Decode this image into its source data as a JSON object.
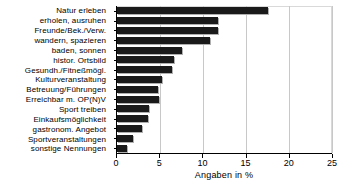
{
  "chart_data": {
    "type": "bar",
    "orientation": "horizontal",
    "title": "",
    "xlabel": "Angaben in %",
    "ylabel": "",
    "xlim": [
      0,
      25
    ],
    "xticks": [
      0,
      5,
      10,
      15,
      20,
      25
    ],
    "xtick_labels": [
      "0",
      "5",
      "10",
      "15",
      "20",
      "25"
    ],
    "grid": true,
    "grid_axis": "x",
    "legend": null,
    "bar_color": "#1a1a1a",
    "categories": [
      "Natur erleben",
      "erholen, ausruhen",
      "Freunde/Bek./Verw.",
      "wandern, spazieren",
      "baden, sonnen",
      "histor. Ortsbild",
      "Gesundh./Fitneßmögl.",
      "Kulturveranstaltung",
      "Betreuung/Führungen",
      "Erreichbar m. OP(N)V",
      "Sport treiben",
      "Einkaufsmöglichkeit",
      "gastronom. Angebot",
      "Sportveranstaltungen",
      "sonstige Nennungen"
    ],
    "values": [
      17.6,
      11.7,
      11.7,
      10.8,
      7.6,
      6.6,
      6.4,
      5.2,
      4.8,
      4.9,
      3.7,
      3.6,
      2.9,
      1.9,
      1.2
    ]
  }
}
